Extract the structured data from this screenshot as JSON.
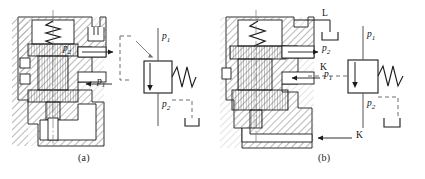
{
  "figure": {
    "type": "engineering-diagram",
    "background": "#ffffff",
    "line_color": "#1a1a1a",
    "hatch_color": "#9a9a9a",
    "dash_color": "#6e6e6e",
    "width": 425,
    "height": 179
  },
  "panels": [
    {
      "id": "a",
      "caption": "(a)",
      "description": "Sectional view of valve with external drain line, plus hydraulic circuit symbol",
      "labels": [
        {
          "name": "p2-port",
          "text": "p",
          "sub": "2",
          "arrow": "right"
        },
        {
          "name": "p1-port",
          "text": "p",
          "sub": "1",
          "arrow": "left"
        },
        {
          "name": "p1-symbol",
          "text": "p",
          "sub": "1",
          "arrow": "none"
        },
        {
          "name": "p2-symbol",
          "text": "p",
          "sub": "2",
          "arrow": "none"
        }
      ],
      "symbol": {
        "name": "pressure-reducing-valve-symbol",
        "elements": [
          "spool-box",
          "spring",
          "pilot-line-dashed",
          "drain-line-dashed",
          "flow-arrow"
        ]
      }
    },
    {
      "id": "b",
      "caption": "(b)",
      "description": "Sectional view of valve with drain port L and control port K, plus hydraulic circuit symbol",
      "labels": [
        {
          "name": "drain-port-L",
          "text": "L",
          "sub": "",
          "arrow": "none"
        },
        {
          "name": "p2-port",
          "text": "p",
          "sub": "2",
          "arrow": "right"
        },
        {
          "name": "p1-port",
          "text": "p",
          "sub": "1",
          "arrow": "left"
        },
        {
          "name": "control-port-K",
          "text": "K",
          "sub": "",
          "arrow": "left"
        },
        {
          "name": "p1-symbol",
          "text": "p",
          "sub": "1",
          "arrow": "none"
        },
        {
          "name": "p2-symbol",
          "text": "p",
          "sub": "2",
          "arrow": "none"
        },
        {
          "name": "K-symbol",
          "text": "K",
          "sub": "",
          "arrow": "none"
        }
      ],
      "symbol": {
        "name": "pressure-reducing-valve-symbol",
        "elements": [
          "spool-box",
          "spring",
          "control-line-dashed",
          "drain-line-dashed",
          "flow-arrow"
        ]
      }
    }
  ]
}
